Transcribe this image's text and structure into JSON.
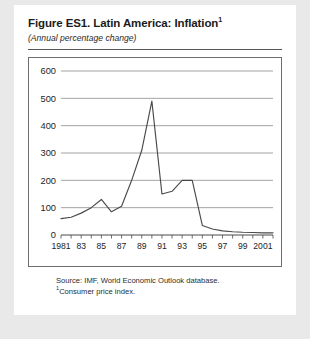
{
  "figure": {
    "title": "Figure ES1. Latin America: Inflation",
    "title_superscript": "1",
    "subtitle": "(Annual percentage change)",
    "source_note": "Source: IMF, World Economic Outlook database.",
    "footnote_marker": "1",
    "footnote_text": "Consumer price index.",
    "page_background": "#e9e9e9",
    "card_background": "#ffffff",
    "line_color": "#4a4a4a",
    "grid_color": "#8c8c8c",
    "frame_color": "#6e6e6e",
    "text_color": "#1d1d1d"
  },
  "chart_data": {
    "type": "line",
    "title": "Figure ES1. Latin America: Inflation",
    "subtitle": "(Annual percentage change)",
    "xlabel": "",
    "ylabel": "",
    "xlim": [
      1981,
      2002
    ],
    "ylim": [
      0,
      600
    ],
    "yticks": [
      0,
      100,
      200,
      300,
      400,
      500,
      600
    ],
    "ytick_labels": [
      "0",
      "100",
      "200",
      "300",
      "400",
      "500",
      "600"
    ],
    "grid": true,
    "legend": false,
    "xticks": [
      1981,
      1982,
      1983,
      1984,
      1985,
      1986,
      1987,
      1988,
      1989,
      1990,
      1991,
      1992,
      1993,
      1994,
      1995,
      1996,
      1997,
      1998,
      1999,
      2000,
      2001,
      2002
    ],
    "xtick_labels": [
      "1981",
      "",
      "83",
      "",
      "85",
      "",
      "87",
      "",
      "89",
      "",
      "91",
      "",
      "93",
      "",
      "95",
      "",
      "97",
      "",
      "99",
      "",
      "2001",
      ""
    ],
    "x": [
      1981,
      1982,
      1983,
      1984,
      1985,
      1986,
      1987,
      1988,
      1989,
      1990,
      1991,
      1992,
      1993,
      1994,
      1995,
      1996,
      1997,
      1998,
      1999,
      2000,
      2001,
      2002
    ],
    "values": [
      60,
      65,
      80,
      100,
      130,
      85,
      105,
      200,
      310,
      490,
      150,
      160,
      200,
      200,
      35,
      22,
      15,
      12,
      10,
      9,
      8,
      8
    ],
    "series": [
      {
        "name": "Latin America inflation (consumer price index)",
        "values": [
          60,
          65,
          80,
          100,
          130,
          85,
          105,
          200,
          310,
          490,
          150,
          160,
          200,
          200,
          35,
          22,
          15,
          12,
          10,
          9,
          8,
          8
        ]
      }
    ]
  }
}
